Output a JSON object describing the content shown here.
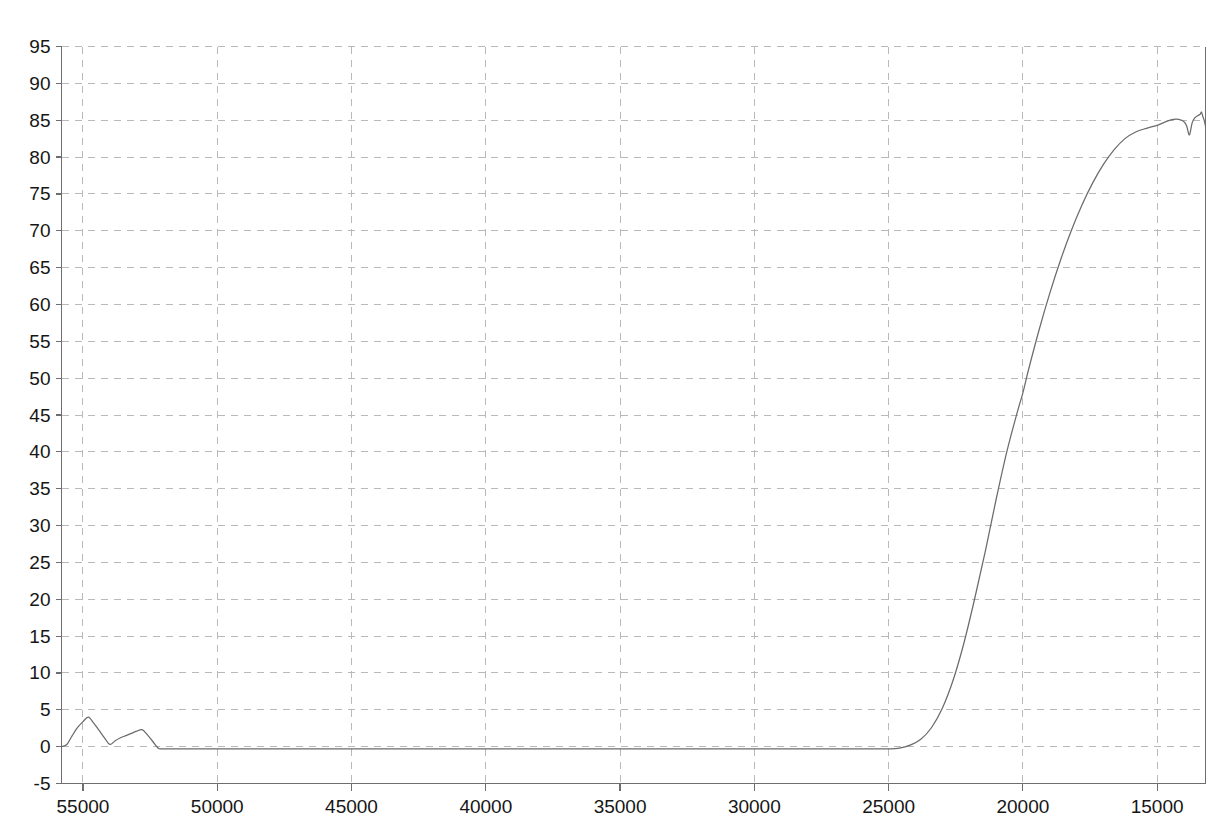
{
  "chart_data": {
    "type": "line",
    "title": "",
    "subtitle": "",
    "xlabel": "",
    "ylabel": "",
    "xlim": [
      55800,
      13200
    ],
    "ylim": [
      -5,
      95
    ],
    "x_axis_reversed": true,
    "grid": true,
    "grid_style": "dashed",
    "legend": null,
    "legend_position": "none",
    "annotations": [],
    "x_ticks": [
      55000,
      50000,
      45000,
      40000,
      35000,
      30000,
      25000,
      20000,
      15000
    ],
    "x_tick_labels": [
      "55000",
      "50000",
      "45000",
      "40000",
      "35000",
      "30000",
      "25000",
      "20000",
      "15000"
    ],
    "y_ticks": [
      -5,
      0,
      5,
      10,
      15,
      20,
      25,
      30,
      35,
      40,
      45,
      50,
      55,
      60,
      65,
      70,
      75,
      80,
      85,
      90,
      95
    ],
    "y_tick_labels": [
      "-5",
      "0",
      "5",
      "10",
      "15",
      "20",
      "25",
      "30",
      "35",
      "40",
      "45",
      "50",
      "55",
      "60",
      "65",
      "70",
      "75",
      "80",
      "85",
      "90",
      "95"
    ],
    "series": [
      {
        "name": "transmittance",
        "color": "#6b6b6b",
        "x": [
          55800,
          55600,
          55400,
          55200,
          55000,
          54800,
          54600,
          54400,
          54200,
          54000,
          53800,
          53600,
          53400,
          53200,
          53000,
          52800,
          52600,
          52400,
          52200,
          52000,
          51000,
          50000,
          48000,
          46000,
          44000,
          42000,
          40000,
          38000,
          36000,
          34000,
          32000,
          30000,
          29000,
          28000,
          27000,
          26000,
          25500,
          25000,
          24600,
          24200,
          23800,
          23400,
          23000,
          22600,
          22200,
          21800,
          21400,
          21000,
          20600,
          20200,
          20000,
          19800,
          19400,
          19000,
          18600,
          18200,
          17800,
          17400,
          17000,
          16600,
          16200,
          15800,
          15400,
          15000,
          14800,
          14600,
          14400,
          14200,
          14000,
          13900,
          13800,
          13700,
          13600,
          13500,
          13400,
          13350,
          13300,
          13250,
          13200
        ],
        "y": [
          0.0,
          0.3,
          1.5,
          2.6,
          3.4,
          4.0,
          3.2,
          2.2,
          1.2,
          0.3,
          0.8,
          1.2,
          1.5,
          1.8,
          2.1,
          2.3,
          1.6,
          0.7,
          -0.2,
          -0.3,
          -0.3,
          -0.3,
          -0.3,
          -0.3,
          -0.3,
          -0.3,
          -0.3,
          -0.3,
          -0.3,
          -0.3,
          -0.3,
          -0.3,
          -0.3,
          -0.3,
          -0.3,
          -0.3,
          -0.3,
          -0.3,
          -0.2,
          0.2,
          1.0,
          2.6,
          5.2,
          9.0,
          14.0,
          20.0,
          26.5,
          33.5,
          40.0,
          45.5,
          48.0,
          51.0,
          56.5,
          61.5,
          66.0,
          70.0,
          73.5,
          76.5,
          79.0,
          81.0,
          82.5,
          83.4,
          83.9,
          84.3,
          84.6,
          84.9,
          85.1,
          85.1,
          84.8,
          84.2,
          83.0,
          84.6,
          85.3,
          85.6,
          85.8,
          86.1,
          85.5,
          85.0,
          84.2
        ],
        "plateau_value": 85,
        "baseline_value": -0.3,
        "transition_midpoint_x": 20200
      }
    ]
  },
  "axes": {
    "y_axis_name": "y-axis",
    "x_axis_name": "x-axis",
    "frame_color": "#6e6e6e",
    "grid_color": "#b9b9b9",
    "background_color": "#ffffff"
  }
}
